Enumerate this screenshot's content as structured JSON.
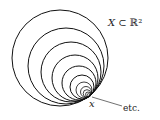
{
  "diagram": {
    "title_label": {
      "symbol": "X",
      "relation": " ⊂ ℝ²"
    },
    "point_label": "x",
    "etc_label": "etc.",
    "tangent_point": {
      "x": 89,
      "y": 96
    },
    "circles": [
      {
        "cx": 60,
        "cy": 58,
        "r": 48
      },
      {
        "cx": 66,
        "cy": 66,
        "r": 38
      },
      {
        "cx": 71,
        "cy": 72,
        "r": 30
      },
      {
        "cx": 75,
        "cy": 78,
        "r": 23
      },
      {
        "cx": 79,
        "cy": 83,
        "r": 17
      },
      {
        "cx": 82,
        "cy": 87,
        "r": 12
      },
      {
        "cx": 84,
        "cy": 90,
        "r": 8
      },
      {
        "cx": 86,
        "cy": 92,
        "r": 5.5
      },
      {
        "cx": 87,
        "cy": 93.5,
        "r": 3.8
      },
      {
        "cx": 88,
        "cy": 94.5,
        "r": 2.5
      },
      {
        "cx": 88.5,
        "cy": 95.2,
        "r": 1.5
      }
    ],
    "stroke_color": "#111111"
  }
}
